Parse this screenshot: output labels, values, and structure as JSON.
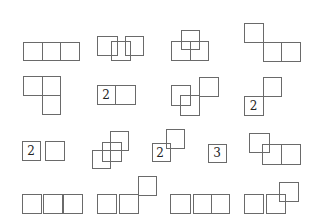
{
  "colors": {
    "stroke": "#6a6a6a",
    "label": "#222222",
    "background": "#ffffff"
  },
  "figures": [
    {
      "id": "r1c1",
      "squares": [
        [
          23,
          42,
          19,
          18
        ],
        [
          42,
          42,
          18,
          18
        ],
        [
          60,
          42,
          19,
          18
        ]
      ],
      "labels": []
    },
    {
      "id": "r1c2",
      "squares": [
        [
          97,
          36,
          20,
          19
        ],
        [
          111,
          41,
          19,
          19
        ],
        [
          125,
          36,
          18,
          19
        ]
      ],
      "labels": []
    },
    {
      "id": "r1c3",
      "squares": [
        [
          181,
          30,
          18,
          19
        ],
        [
          171,
          41,
          19,
          19
        ],
        [
          190,
          41,
          18,
          19
        ]
      ],
      "labels": []
    },
    {
      "id": "r1c4",
      "squares": [
        [
          244,
          23,
          19,
          19
        ],
        [
          263,
          42,
          18,
          19
        ],
        [
          281,
          42,
          19,
          19
        ]
      ],
      "labels": []
    },
    {
      "id": "r2c1",
      "squares": [
        [
          23,
          76,
          19,
          19
        ],
        [
          42,
          76,
          18,
          19
        ],
        [
          42,
          95,
          18,
          19
        ]
      ],
      "labels": []
    },
    {
      "id": "r2c2",
      "squares": [
        [
          97,
          85,
          18,
          19
        ],
        [
          115,
          85,
          20,
          19
        ]
      ],
      "labels": [
        {
          "text": "2",
          "x": 106,
          "y": 94.5
        }
      ]
    },
    {
      "id": "r2c3",
      "squares": [
        [
          171,
          85,
          19,
          20
        ],
        [
          180,
          95,
          19,
          20
        ],
        [
          199,
          77,
          19,
          19
        ]
      ],
      "labels": []
    },
    {
      "id": "r2c4",
      "squares": [
        [
          263,
          77,
          18,
          19
        ],
        [
          244,
          96,
          19,
          19
        ]
      ],
      "labels": [
        {
          "text": "2",
          "x": 253.5,
          "y": 105.5
        }
      ]
    },
    {
      "id": "r3c1",
      "squares": [
        [
          22,
          141,
          18,
          19
        ],
        [
          45,
          141,
          19,
          19
        ]
      ],
      "labels": [
        {
          "text": "2",
          "x": 31,
          "y": 150.5
        }
      ]
    },
    {
      "id": "r3c2",
      "squares": [
        [
          110,
          131,
          18,
          19
        ],
        [
          102,
          142,
          19,
          19
        ],
        [
          92,
          150,
          18,
          18
        ]
      ],
      "labels": []
    },
    {
      "id": "r3c3",
      "squares": [
        [
          152,
          143,
          18,
          18
        ],
        [
          166,
          129,
          18,
          19
        ]
      ],
      "labels": [
        {
          "text": "2",
          "x": 160,
          "y": 153
        }
      ]
    },
    {
      "id": "r3c3b",
      "squares": [
        [
          208,
          144,
          18,
          18
        ]
      ],
      "labels": [
        {
          "text": "3",
          "x": 217,
          "y": 153
        }
      ]
    },
    {
      "id": "r3c4",
      "squares": [
        [
          249,
          133,
          20,
          19
        ],
        [
          262,
          144,
          19,
          20
        ],
        [
          281,
          144,
          19,
          20
        ]
      ],
      "labels": []
    },
    {
      "id": "r4c1",
      "squares": [
        [
          22,
          194,
          19,
          19
        ],
        [
          43,
          194,
          19,
          19
        ],
        [
          63,
          194,
          19,
          19
        ]
      ],
      "labels": []
    },
    {
      "id": "r4c2",
      "squares": [
        [
          97,
          194,
          19,
          19
        ],
        [
          119,
          194,
          19,
          19
        ],
        [
          138,
          176,
          18,
          19
        ]
      ],
      "labels": []
    },
    {
      "id": "r4c3",
      "squares": [
        [
          170,
          194,
          20,
          19
        ],
        [
          193,
          194,
          18,
          19
        ],
        [
          211,
          194,
          18,
          19
        ]
      ],
      "labels": []
    },
    {
      "id": "r4c4",
      "squares": [
        [
          244,
          194,
          19,
          19
        ],
        [
          266,
          194,
          19,
          19
        ],
        [
          279,
          182,
          19,
          19
        ]
      ],
      "labels": []
    }
  ]
}
